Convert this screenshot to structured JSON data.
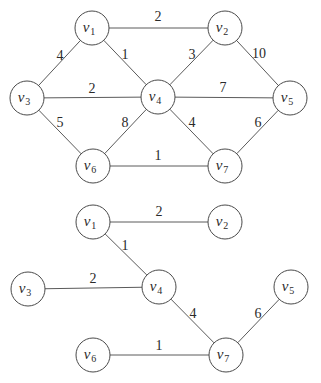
{
  "style": {
    "line_color": "#5a5a5a",
    "circle_stroke": "#4a4a4a",
    "text_color": "#2a2a2a",
    "background": "#ffffff",
    "node_radius": 17
  },
  "graphs": [
    {
      "name": "original-weighted-graph",
      "nodes": [
        {
          "id": "v1",
          "letter": "v",
          "sub": "1",
          "x": 92,
          "y": 28
        },
        {
          "id": "v2",
          "letter": "v",
          "sub": "2",
          "x": 225,
          "y": 28
        },
        {
          "id": "v3",
          "letter": "v",
          "sub": "3",
          "x": 27,
          "y": 98
        },
        {
          "id": "v4",
          "letter": "v",
          "sub": "4",
          "x": 158,
          "y": 97
        },
        {
          "id": "v5",
          "letter": "v",
          "sub": "5",
          "x": 290,
          "y": 98
        },
        {
          "id": "v6",
          "letter": "v",
          "sub": "6",
          "x": 93,
          "y": 166
        },
        {
          "id": "v7",
          "letter": "v",
          "sub": "7",
          "x": 225,
          "y": 166
        }
      ],
      "edges": [
        {
          "from": "v1",
          "to": "v2",
          "weight": "2",
          "lx": 158,
          "ly": 21
        },
        {
          "from": "v1",
          "to": "v3",
          "weight": "4",
          "lx": 60,
          "ly": 60
        },
        {
          "from": "v1",
          "to": "v4",
          "weight": "1",
          "lx": 125,
          "ly": 59
        },
        {
          "from": "v2",
          "to": "v4",
          "weight": "3",
          "lx": 192,
          "ly": 59
        },
        {
          "from": "v2",
          "to": "v5",
          "weight": "10",
          "lx": 259,
          "ly": 58
        },
        {
          "from": "v3",
          "to": "v4",
          "weight": "2",
          "lx": 92,
          "ly": 93
        },
        {
          "from": "v4",
          "to": "v5",
          "weight": "7",
          "lx": 223,
          "ly": 92
        },
        {
          "from": "v3",
          "to": "v6",
          "weight": "5",
          "lx": 60,
          "ly": 127
        },
        {
          "from": "v4",
          "to": "v6",
          "weight": "8",
          "lx": 125,
          "ly": 127
        },
        {
          "from": "v4",
          "to": "v7",
          "weight": "4",
          "lx": 192,
          "ly": 127
        },
        {
          "from": "v5",
          "to": "v7",
          "weight": "6",
          "lx": 258,
          "ly": 127
        },
        {
          "from": "v6",
          "to": "v7",
          "weight": "1",
          "lx": 158,
          "ly": 160
        }
      ]
    },
    {
      "name": "minimum-spanning-tree",
      "nodes": [
        {
          "id": "v1",
          "letter": "v",
          "sub": "1",
          "x": 93,
          "y": 222
        },
        {
          "id": "v2",
          "letter": "v",
          "sub": "2",
          "x": 225,
          "y": 222
        },
        {
          "id": "v3",
          "letter": "v",
          "sub": "3",
          "x": 28,
          "y": 289
        },
        {
          "id": "v4",
          "letter": "v",
          "sub": "4",
          "x": 159,
          "y": 287
        },
        {
          "id": "v5",
          "letter": "v",
          "sub": "5",
          "x": 291,
          "y": 287
        },
        {
          "id": "v6",
          "letter": "v",
          "sub": "6",
          "x": 93,
          "y": 355
        },
        {
          "id": "v7",
          "letter": "v",
          "sub": "7",
          "x": 226,
          "y": 355
        }
      ],
      "edges": [
        {
          "from": "v1",
          "to": "v2",
          "weight": "2",
          "lx": 159,
          "ly": 216
        },
        {
          "from": "v1",
          "to": "v4",
          "weight": "1",
          "lx": 125,
          "ly": 250
        },
        {
          "from": "v3",
          "to": "v4",
          "weight": "2",
          "lx": 93,
          "ly": 283
        },
        {
          "from": "v4",
          "to": "v7",
          "weight": "4",
          "lx": 193,
          "ly": 318
        },
        {
          "from": "v5",
          "to": "v7",
          "weight": "6",
          "lx": 258,
          "ly": 318
        },
        {
          "from": "v6",
          "to": "v7",
          "weight": "1",
          "lx": 159,
          "ly": 350
        }
      ]
    }
  ]
}
